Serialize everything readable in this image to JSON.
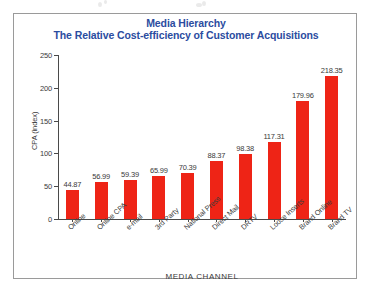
{
  "chart_data": {
    "type": "bar",
    "title": "Media Hierarchy",
    "subtitle": "The Relative Cost-efficiency of Customer Acquisitions",
    "title_line1": "Media Hierarchy",
    "title_line2": "The Relative Cost-efficiency of Customer Acquisitions",
    "xlabel": "MEDIA CHANNEL",
    "ylabel": "CPA (index)",
    "ylim": [
      0,
      250
    ],
    "ytick_step": 50,
    "yticks": [
      "0",
      "50",
      "100",
      "150",
      "200",
      "250"
    ],
    "grid": false,
    "legend": "none",
    "bar_color": "#EE2416",
    "title_color": "#2B4CA0",
    "axis_color": "#4A4A4A",
    "categories": [
      "Online",
      "Online CPA",
      "e-mail",
      "3rd Party",
      "National Press",
      "Direct Mail",
      "DRTV",
      "Loose Inserts",
      "Brand Online",
      "Brand TV"
    ],
    "values": [
      44.87,
      56.99,
      59.39,
      65.99,
      70.39,
      88.37,
      98.38,
      117.31,
      179.96,
      218.35
    ],
    "value_labels": [
      "44.87",
      "56.99",
      "59.39",
      "65.99",
      "70.39",
      "88.37",
      "98.38",
      "117.31",
      "179.96",
      "218.35"
    ]
  }
}
